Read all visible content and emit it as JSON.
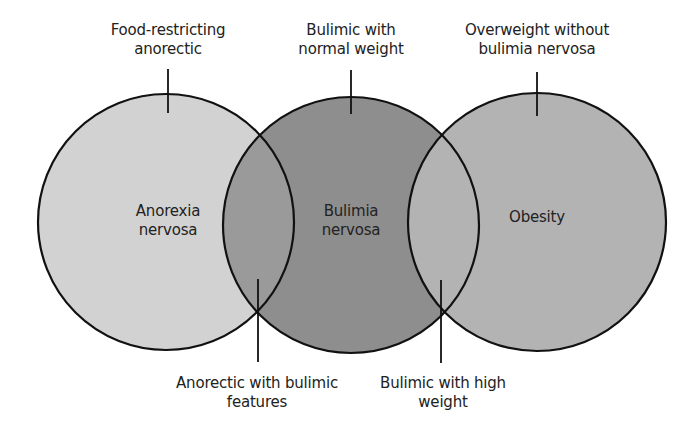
{
  "diagram": {
    "type": "venn",
    "colors": {
      "anorexia_fill": "#d2d2d2",
      "bulimia_fill": "#8e8e8e",
      "obesity_fill": "#b3b3b3",
      "overlap_left_fill": "#9c9c9c",
      "overlap_right_fill": "#b3b3b3",
      "stroke": "#111111",
      "background": "#ffffff"
    },
    "circles": [
      {
        "id": "anorexia",
        "line1": "Anorexia",
        "line2": "nervosa"
      },
      {
        "id": "bulimia",
        "line1": "Bulimia",
        "line2": "nervosa"
      },
      {
        "id": "obesity",
        "line1": "Obesity",
        "line2": ""
      }
    ],
    "top_labels": [
      {
        "line1": "Food-restricting",
        "line2": "anorectic"
      },
      {
        "line1": "Bulimic with",
        "line2": "normal weight"
      },
      {
        "line1": "Overweight without",
        "line2": "bulimia nervosa"
      }
    ],
    "bottom_labels": [
      {
        "line1": "Anorectic with bulimic",
        "line2": "features"
      },
      {
        "line1": "Bulimic with high",
        "line2": "weight"
      }
    ]
  }
}
